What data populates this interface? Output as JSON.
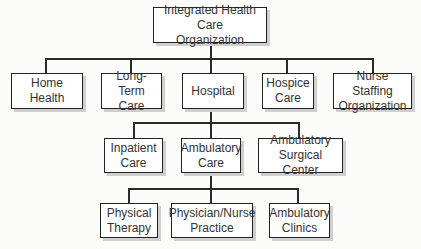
{
  "diagram": {
    "type": "org-chart",
    "root": {
      "label_line1": "Integrated Health Care",
      "label_line2": "Organization"
    },
    "level1": [
      {
        "line1": "Home Health",
        "line2": ""
      },
      {
        "line1": "Long-Term",
        "line2": "Care"
      },
      {
        "line1": "Hospital",
        "line2": ""
      },
      {
        "line1": "Hospice",
        "line2": "Care"
      },
      {
        "line1": "Nurse Staffing",
        "line2": "Organization"
      }
    ],
    "level2": [
      {
        "line1": "Inpatient",
        "line2": "Care"
      },
      {
        "line1": "Ambulatory",
        "line2": "Care"
      },
      {
        "line1": "Ambulatory",
        "line2": "Surgical Center"
      }
    ],
    "level3": [
      {
        "line1": "Physical",
        "line2": "Therapy"
      },
      {
        "line1": "Physician/Nurse",
        "line2": "Practice"
      },
      {
        "line1": "Ambulatory",
        "line2": "Clinics"
      }
    ],
    "relationships": [
      {
        "parent": "Integrated Health Care Organization",
        "children": [
          "Home Health",
          "Long-Term Care",
          "Hospital",
          "Hospice Care",
          "Nurse Staffing Organization"
        ]
      },
      {
        "parent": "Hospital",
        "children": [
          "Inpatient Care",
          "Ambulatory Care",
          "Ambulatory Surgical Center"
        ]
      },
      {
        "parent": "Ambulatory Care",
        "children": [
          "Physical Therapy",
          "Physician/Nurse Practice",
          "Ambulatory Clinics"
        ]
      }
    ]
  }
}
